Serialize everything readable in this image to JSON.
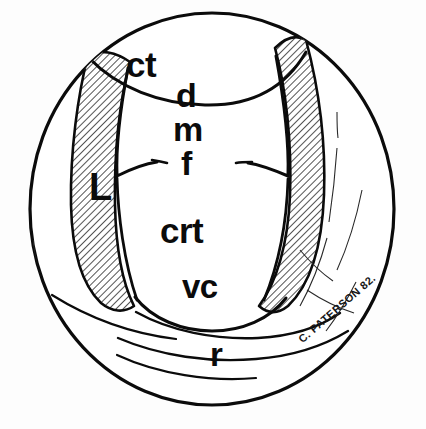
{
  "figure": {
    "signature": "C. PATERSON 82.",
    "ink_color": "#0b0b0b",
    "background_color": "#fdfdfd",
    "hatch_color": "#1a1a1a",
    "labels": [
      {
        "key": "ct",
        "text": "ct",
        "region": "upper-central-band"
      },
      {
        "key": "d",
        "text": "d",
        "region": "upper-right-of-centre"
      },
      {
        "key": "m",
        "text": "m",
        "region": "mid-centre-upper"
      },
      {
        "key": "f",
        "text": "f",
        "region": "mid-centre"
      },
      {
        "key": "L",
        "text": "L",
        "region": "left-hatched-band"
      },
      {
        "key": "crt",
        "text": "crt",
        "region": "lower-centre"
      },
      {
        "key": "vc",
        "text": "vc",
        "region": "lower-centre-below-crt"
      },
      {
        "key": "r",
        "text": "r",
        "region": "bottom-outer-ring"
      }
    ],
    "regions": [
      {
        "name": "outer-disc",
        "fill": "none",
        "stroke": "#0b0b0b"
      },
      {
        "name": "left-hatched-band",
        "fill": "hatched",
        "stroke": "#0b0b0b"
      },
      {
        "name": "right-hatched-band",
        "fill": "hatched",
        "stroke": "#0b0b0b"
      },
      {
        "name": "central-lobe",
        "fill": "none",
        "stroke": "#0b0b0b"
      },
      {
        "name": "upper-lobe",
        "fill": "none",
        "stroke": "#0b0b0b"
      },
      {
        "name": "bottom-rings",
        "fill": "none",
        "stroke": "#0b0b0b"
      }
    ]
  }
}
